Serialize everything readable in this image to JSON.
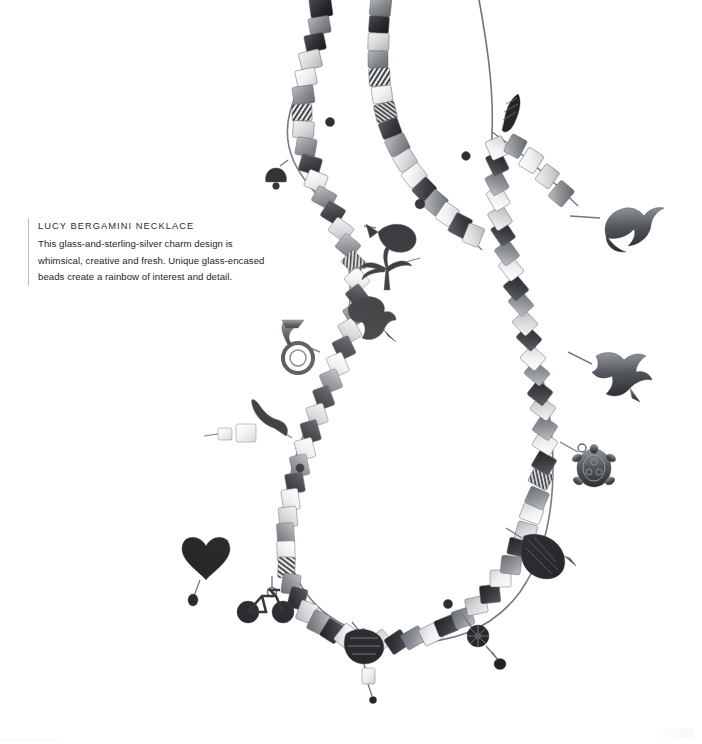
{
  "page": {
    "background_color": "#ffffff",
    "width": 702,
    "height": 744
  },
  "caption": {
    "title": "LUCY BERGAMINI NECKLACE",
    "rule_color": "#b9bcc0",
    "text_color": "#24262a",
    "lines": [
      "This glass-and-sterling-silver charm design is",
      "whimsical, creative and fresh. Unique glass-encased",
      "beads create a rainbow of interest and detail."
    ],
    "full_text": "This glass-and-sterling-silver charm design is whimsical, creative and fresh. Unique glass-encased beads create a rainbow of interest and detail."
  },
  "photograph": {
    "subject": "beaded charm necklace",
    "palette": {
      "bead_dark": "#2e3034",
      "bead_mid": "#8a8d91",
      "bead_light": "#d6d8da",
      "bead_clear": "#eef0f1",
      "charm_silver": "#4a4d52",
      "charm_black": "#1c1e21",
      "wire": "#6e7176"
    },
    "charms": [
      {
        "name": "dolphin-charm",
        "x": 620,
        "y": 222
      },
      {
        "name": "hummingbird-charm",
        "x": 616,
        "y": 372
      },
      {
        "name": "turtle-charm",
        "x": 594,
        "y": 466
      },
      {
        "name": "leaf-charm",
        "x": 536,
        "y": 552
      },
      {
        "name": "flower-charm",
        "x": 478,
        "y": 635
      },
      {
        "name": "strawberry-charm",
        "x": 364,
        "y": 640
      },
      {
        "name": "teardrop-bead-charm",
        "x": 371,
        "y": 676
      },
      {
        "name": "bicycle-charm",
        "x": 263,
        "y": 602
      },
      {
        "name": "heart-charm",
        "x": 206,
        "y": 560
      },
      {
        "name": "chili-pepper-charm",
        "x": 258,
        "y": 416
      },
      {
        "name": "french-horn-charm",
        "x": 294,
        "y": 344
      },
      {
        "name": "rooster-charm",
        "x": 372,
        "y": 308
      },
      {
        "name": "palm-tree-charm",
        "x": 385,
        "y": 268
      },
      {
        "name": "fish-charm",
        "x": 380,
        "y": 232
      },
      {
        "name": "pinecone-charm",
        "x": 508,
        "y": 106
      },
      {
        "name": "bell-charm",
        "x": 276,
        "y": 176
      }
    ]
  }
}
